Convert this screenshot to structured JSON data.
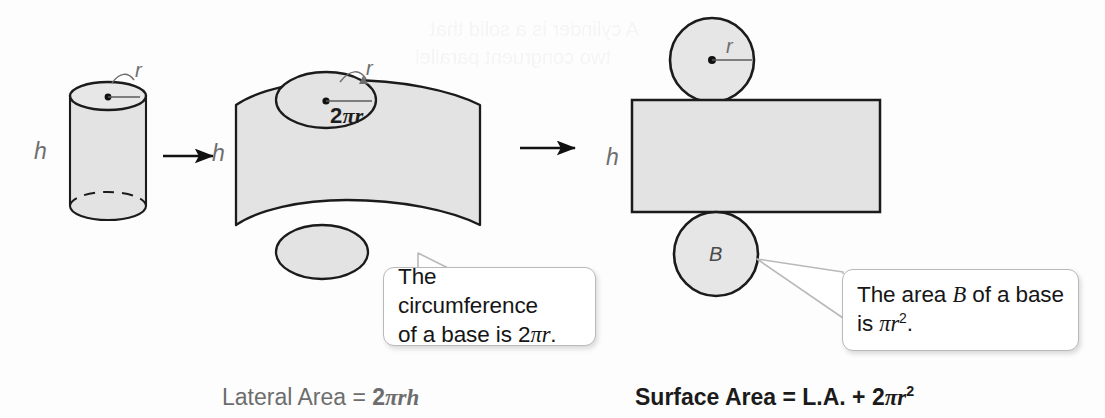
{
  "figure": {
    "fill_color": "#e3e3e3",
    "stroke_color": "#1b1b1b",
    "label_color": "#6e6e6e"
  },
  "stage_left": {
    "name": "cylinder",
    "label_h": "h",
    "label_r": "r"
  },
  "stage_middle": {
    "name": "partially-unrolled-cylinder",
    "label_h": "h",
    "label_r": "r",
    "label_circumference_prefix": "2",
    "label_circumference_pi": "π",
    "label_circumference_r": "r"
  },
  "stage_right": {
    "name": "flattened-net",
    "label_h": "h",
    "label_r": "r",
    "label_base": "B"
  },
  "arrows": [
    {
      "name": "arrow-1"
    },
    {
      "name": "arrow-2"
    }
  ],
  "callouts": [
    {
      "id": "circumference",
      "line1": "The circumference",
      "line2_pre": "of a base is ",
      "line2_math_num": "2",
      "line2_math_pi": "π",
      "line2_math_var": "r",
      "line2_post": "."
    },
    {
      "id": "area",
      "line1_pre": "The area ",
      "line1_var": "B",
      "line1_post": " of a base",
      "line2_pre": "is ",
      "line2_pi": "π",
      "line2_var": "r",
      "line2_exp": "2",
      "line2_post": "."
    }
  ],
  "captions": {
    "lateral": {
      "text": "Lateral Area = ",
      "math_num": "2",
      "math_pi": "π",
      "math_r": "r",
      "math_h": "h"
    },
    "surface": {
      "text": "Surface Area = L.A. + ",
      "math_num": "2",
      "math_pi": "π",
      "math_r": "r",
      "math_exp": "2"
    }
  },
  "ghost_text": {
    "line1": "A cylinder is a solid that",
    "line2": "two congruent parallel"
  }
}
